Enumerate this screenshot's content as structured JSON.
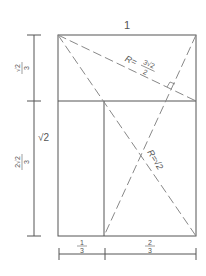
{
  "diagram": {
    "top_label": "1",
    "left_labels": {
      "upper_num": "√2",
      "upper_den": "3",
      "whole": "√2",
      "lower_num": "2√2",
      "lower_den": "3"
    },
    "bottom_labels": {
      "left_num": "1",
      "left_den": "3",
      "right_num": "2",
      "right_den": "3"
    },
    "radius_labels": {
      "upper_prefix": "R=",
      "upper_num": "3√2",
      "upper_den": "2",
      "lower": "R=√2"
    },
    "colors": {
      "line": "#555555",
      "dashed": "#888888",
      "text": "#555555"
    }
  }
}
